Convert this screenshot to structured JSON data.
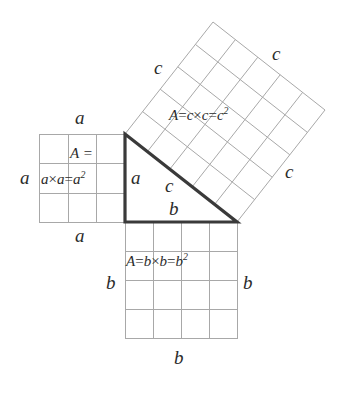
{
  "figure": {
    "background_color": "#ffffff",
    "line_color": "#9a9a9a",
    "triangle_color": "#3a3a3a",
    "text_color": "#2b2b2b"
  },
  "triangle": {
    "name": "right-triangle",
    "leg_a_label": "a",
    "leg_b_label": "b",
    "hypotenuse_label": "c",
    "vertices": {
      "top_left": [
        125,
        134
      ],
      "bottom_left": [
        125,
        222
      ],
      "bottom_right": [
        237,
        222
      ]
    }
  },
  "square_a": {
    "name": "square-a-squared",
    "grid_rows": 3,
    "grid_cols": 3,
    "side_length_units": 3,
    "area_label_line1": "A =",
    "area_label_line2_parts": {
      "var1": "a",
      "operator": "×",
      "var2": "a",
      "equals": "=",
      "result_base": "a",
      "result_exp": "2"
    },
    "side_labels": {
      "top": "a",
      "left": "a",
      "right": "a",
      "bottom": "a"
    }
  },
  "square_b": {
    "name": "square-b-squared",
    "grid_rows": 4,
    "grid_cols": 4,
    "side_length_units": 4,
    "area_label_parts": {
      "A": "A",
      "equals1": "=",
      "var1": "b",
      "operator": "×",
      "var2": "b",
      "equals2": "=",
      "result_base": "b",
      "result_exp": "2"
    },
    "side_labels": {
      "left": "b",
      "right": "b",
      "bottom": "b",
      "top": "b"
    }
  },
  "square_c": {
    "name": "square-c-squared",
    "grid_rows": 5,
    "grid_cols": 5,
    "side_length_units": 5,
    "rotation_degrees": -38,
    "area_label_parts": {
      "A": "A",
      "equals1": "=",
      "var1": "c",
      "operator": "×",
      "var2": "c",
      "equals2": "=",
      "result_base": "c",
      "result_exp": "2"
    },
    "side_labels": {
      "upper_left": "c",
      "upper_right": "c",
      "lower_right": "c",
      "inner": "c"
    }
  }
}
